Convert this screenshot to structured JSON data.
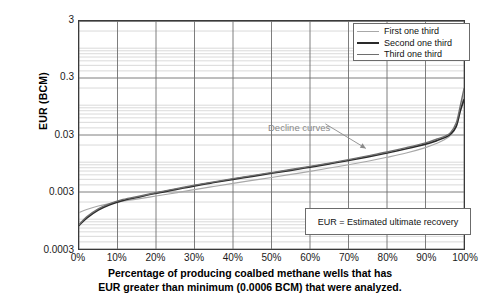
{
  "chart_data": {
    "type": "line",
    "title": "",
    "xlabel": "Percentage of producing coalbed methane wells that has EUR greater than minimum (0.0006 BCM) that were analyzed.",
    "ylabel": "EUR (BCM)",
    "yscale": "log",
    "ylim": [
      0.0003,
      3
    ],
    "xlim": [
      0,
      100
    ],
    "grid": true,
    "legend_position": "top-right",
    "x_tick_labels": [
      "0%",
      "10%",
      "20%",
      "30%",
      "40%",
      "50%",
      "60%",
      "70%",
      "80%",
      "90%",
      "100%"
    ],
    "x_tick_values": [
      0,
      10,
      20,
      30,
      40,
      50,
      60,
      70,
      80,
      90,
      100
    ],
    "y_tick_labels": [
      "3",
      "0.3",
      "0.03",
      "0.003",
      "0.0003"
    ],
    "y_tick_values": [
      3,
      0.3,
      0.03,
      0.003,
      0.0003
    ],
    "series": [
      {
        "name": "First one third",
        "color": "#a8a8a8",
        "x": [
          0,
          2,
          5,
          8,
          11,
          15,
          20,
          25,
          30,
          35,
          40,
          45,
          50,
          55,
          60,
          65,
          70,
          75,
          80,
          85,
          90,
          93,
          95,
          96.5,
          98,
          99,
          100
        ],
        "values": [
          0.0013,
          0.00148,
          0.0017,
          0.00188,
          0.00205,
          0.00225,
          0.00255,
          0.00288,
          0.0033,
          0.00375,
          0.00425,
          0.0048,
          0.0054,
          0.0061,
          0.0069,
          0.0079,
          0.009,
          0.0104,
          0.0122,
          0.0145,
          0.018,
          0.0215,
          0.025,
          0.0295,
          0.042,
          0.075,
          0.15
        ]
      },
      {
        "name": "Second one third",
        "color": "#2a2a2a",
        "x": [
          0,
          2,
          5,
          8,
          11,
          15,
          20,
          25,
          30,
          35,
          40,
          45,
          50,
          55,
          60,
          65,
          70,
          75,
          80,
          85,
          90,
          93,
          95,
          96.5,
          98,
          99,
          100
        ],
        "values": [
          0.00078,
          0.00105,
          0.00145,
          0.0018,
          0.0021,
          0.0024,
          0.00285,
          0.0033,
          0.00385,
          0.0044,
          0.005,
          0.00565,
          0.0064,
          0.0072,
          0.0082,
          0.00935,
          0.0107,
          0.0124,
          0.0145,
          0.0172,
          0.0208,
          0.024,
          0.027,
          0.031,
          0.043,
          0.078,
          0.125
        ]
      },
      {
        "name": "Third one third",
        "color": "#6e6e6e",
        "x": [
          0,
          2,
          5,
          8,
          11,
          15,
          20,
          25,
          30,
          35,
          40,
          45,
          50,
          55,
          60,
          65,
          70,
          75,
          80,
          85,
          90,
          93,
          95,
          96.5,
          98,
          99,
          100
        ],
        "values": [
          0.0008,
          0.0011,
          0.00152,
          0.00188,
          0.00218,
          0.00248,
          0.00292,
          0.0034,
          0.00395,
          0.00452,
          0.00515,
          0.00582,
          0.00658,
          0.00745,
          0.00845,
          0.00965,
          0.0111,
          0.0129,
          0.0151,
          0.018,
          0.0218,
          0.0255,
          0.0285,
          0.033,
          0.049,
          0.095,
          0.195
        ]
      }
    ],
    "annotations": [
      {
        "text": "Decline curves",
        "color": "#8a8a8a",
        "x": 58,
        "y": 0.055
      }
    ],
    "note_box": {
      "text": "EUR = Estimated ultimate recovery"
    }
  },
  "legend": {
    "items": [
      {
        "label": "First one third"
      },
      {
        "label": "Second one third"
      },
      {
        "label": "Third one third"
      }
    ]
  },
  "axes": {
    "y_title": "EUR (BCM)",
    "x_title_line1": "Percentage of producing coalbed methane wells that has",
    "x_title_line2": "EUR greater than minimum (0.0006 BCM) that were analyzed."
  },
  "colors": {
    "series1": "#a8a8a8",
    "series2": "#2a2a2a",
    "series3": "#6e6e6e",
    "frame": "#3a3a3a",
    "major_grid": "#6e6e6e",
    "minor_grid": "#b9b9b9",
    "annotation": "#8a8a8a"
  }
}
